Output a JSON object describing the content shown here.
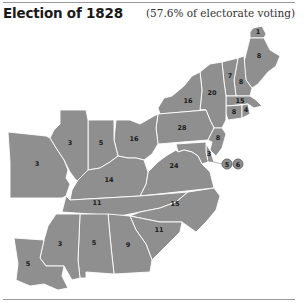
{
  "header": {
    "title": "Election of 1828",
    "subtitle": "(57.6% of electorate voting)"
  },
  "map": {
    "fill_color": "#8f8f8f",
    "border_color": "#ffffff",
    "states": [
      {
        "id": "maine-north",
        "label": "1"
      },
      {
        "id": "maine",
        "label": "8"
      },
      {
        "id": "new-hampshire",
        "label": "8"
      },
      {
        "id": "vermont",
        "label": "7"
      },
      {
        "id": "massachusetts",
        "label": "15"
      },
      {
        "id": "connecticut",
        "label": "8"
      },
      {
        "id": "rhode-island",
        "label": "4"
      },
      {
        "id": "new-york-east",
        "label": "20"
      },
      {
        "id": "new-york-west",
        "label": "16"
      },
      {
        "id": "pennsylvania",
        "label": "28"
      },
      {
        "id": "new-jersey",
        "label": "8"
      },
      {
        "id": "delaware",
        "label": "3"
      },
      {
        "id": "maryland-a",
        "label": "5"
      },
      {
        "id": "maryland-b",
        "label": "6"
      },
      {
        "id": "virginia",
        "label": "24"
      },
      {
        "id": "ohio",
        "label": "16"
      },
      {
        "id": "indiana",
        "label": "5"
      },
      {
        "id": "illinois",
        "label": "3"
      },
      {
        "id": "missouri",
        "label": "3"
      },
      {
        "id": "kentucky",
        "label": "14"
      },
      {
        "id": "tennessee",
        "label": "11"
      },
      {
        "id": "north-carolina",
        "label": "15"
      },
      {
        "id": "south-carolina",
        "label": "11"
      },
      {
        "id": "georgia",
        "label": "9"
      },
      {
        "id": "alabama",
        "label": "5"
      },
      {
        "id": "mississippi",
        "label": "3"
      },
      {
        "id": "louisiana",
        "label": "5"
      }
    ]
  }
}
